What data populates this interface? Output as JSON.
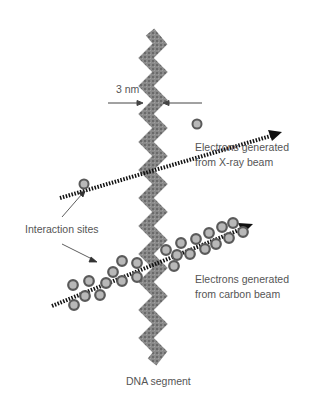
{
  "labels": {
    "width": "3 nm",
    "xray": [
      "Electrons generated",
      "from X-ray beam"
    ],
    "interaction": "Interaction sites",
    "carbon": [
      "Electrons generated",
      "from carbon beam"
    ],
    "dna": "DNA segment"
  },
  "colors": {
    "dna": "#7a7a7a",
    "electron_fill": "#b8b8b8",
    "electron_stroke": "#5a5a5a",
    "beam": "#111111",
    "text": "#555555"
  }
}
